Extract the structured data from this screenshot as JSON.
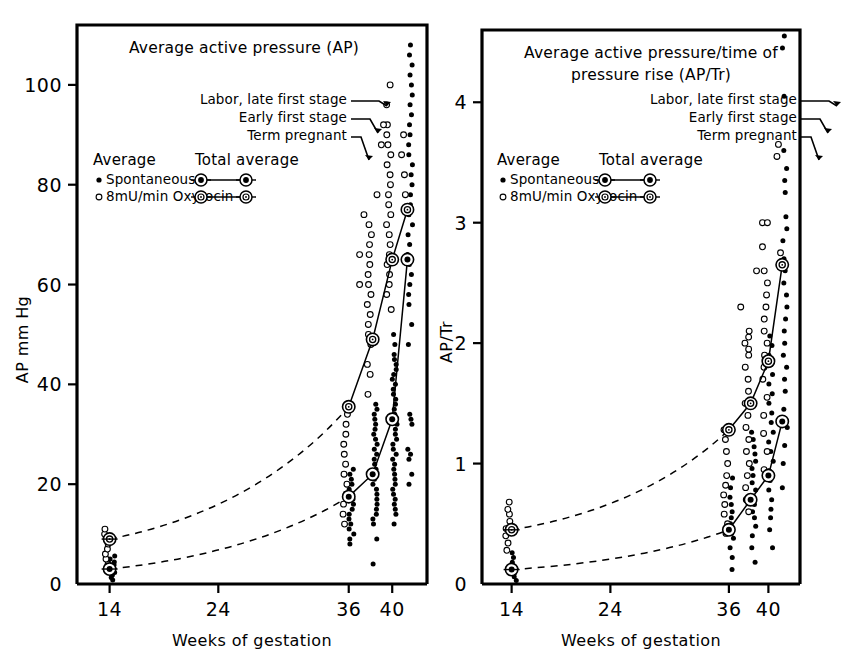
{
  "figure": {
    "background": "#ffffff",
    "ink": "#000000",
    "panel_count": 2
  },
  "panels": [
    {
      "id": "left",
      "title": [
        "Average active pressure (AP)"
      ],
      "ylabel": "AP mm Hg",
      "xlabel": "Weeks of gestation",
      "yticks": [
        "0",
        "20",
        "40",
        "60",
        "80",
        "100"
      ],
      "ytick_values": [
        0,
        20,
        40,
        60,
        80,
        100
      ],
      "xticks": [
        "14",
        "24",
        "36",
        "40"
      ],
      "xtick_values": [
        14,
        24,
        36,
        40
      ],
      "ylim": [
        0,
        112
      ],
      "xlim": [
        11,
        43.2
      ]
    },
    {
      "id": "right",
      "title": [
        "Average active pressure/time of",
        "pressure rise (AP/Tr)"
      ],
      "ylabel": "AP/Tr",
      "xlabel": "Weeks of gestation",
      "yticks": [
        "0",
        "1",
        "2",
        "3",
        "4"
      ],
      "ytick_values": [
        0,
        1,
        2,
        3,
        4
      ],
      "xticks": [
        "14",
        "24",
        "36",
        "40"
      ],
      "xtick_values": [
        14,
        24,
        36,
        40
      ],
      "ylim": [
        0,
        4.6
      ],
      "xlim": [
        11,
        43.2
      ]
    }
  ],
  "legend": {
    "average_heading": "Average",
    "total_average_heading": "Total average",
    "items": [
      {
        "marker": "filled-circle",
        "label": "Spontaneous"
      },
      {
        "marker": "open-circle",
        "label": "8mU/min Oxytocin"
      }
    ]
  },
  "annotations": [
    {
      "text": "Labor, late first stage"
    },
    {
      "text": "Early first stage"
    },
    {
      "text": "Term pregnant"
    }
  ],
  "chart_data": {
    "type": "scatter",
    "grid": false,
    "legend_position": "upper-left-inside",
    "panels": [
      {
        "id": "left",
        "title": "Average active pressure (AP)",
        "xlabel": "Weeks of gestation",
        "ylabel": "AP mm Hg",
        "xlim": [
          11,
          43.2
        ],
        "ylim": [
          0,
          112
        ],
        "xticks": [
          14,
          24,
          36,
          40
        ],
        "yticks": [
          0,
          20,
          40,
          60,
          80,
          100
        ],
        "series": [
          {
            "name": "Spontaneous",
            "marker": "filled-circle",
            "total_average_x": [
              14,
              36,
              38.2,
              40,
              41.4
            ],
            "total_average_y": [
              3.0,
              17.5,
              22.0,
              33.0,
              65.0
            ],
            "scatter": [
              {
                "x": 14,
                "values": [
                  0.8,
                  1.3,
                  1.8,
                  2.3,
                  2.8,
                  3.3,
                  3.8,
                  4.4,
                  5.0,
                  5.6
                ]
              },
              {
                "x": 36,
                "values": [
                  8.0,
                  9.0,
                  10.0,
                  11.0,
                  12.0,
                  13.0,
                  14.0,
                  15.0,
                  16.0,
                  17.0,
                  18.0,
                  19.0,
                  20.0,
                  21.0,
                  22.0,
                  23.0
                ]
              },
              {
                "x": 38.2,
                "values": [
                  4.0,
                  9.0,
                  12.0,
                  13.0,
                  14.0,
                  15.0,
                  16.0,
                  17.0,
                  18.0,
                  19.0,
                  20.0,
                  21.0,
                  22.0,
                  23.0,
                  24.0,
                  25.0,
                  26.0,
                  27.0,
                  28.0,
                  29.0,
                  30.0,
                  31.0,
                  32.0,
                  33.0,
                  34.0,
                  35.0,
                  36.0
                ]
              },
              {
                "x": 40,
                "values": [
                  12.0,
                  14.0,
                  15.0,
                  16.0,
                  17.0,
                  18.0,
                  19.0,
                  20.0,
                  21.0,
                  22.0,
                  23.0,
                  24.0,
                  25.0,
                  26.0,
                  27.0,
                  28.0,
                  29.0,
                  30.0,
                  31.0,
                  32.0,
                  33.0,
                  34.0,
                  35.0,
                  36.0,
                  37.0,
                  38.0,
                  39.0,
                  40.0,
                  41.0,
                  42.0,
                  43.0,
                  44.0,
                  45.0,
                  46.0,
                  48.0,
                  50.0
                ]
              },
              {
                "x": 41.4,
                "values": [
                  20.0,
                  22.0,
                  25.0,
                  26.0,
                  27.0,
                  32.0,
                  33.0,
                  34.0,
                  48.0,
                  52.0,
                  56.0,
                  58.0,
                  60.0,
                  62.0,
                  64.0,
                  66.0,
                  68.0,
                  70.0,
                  72.0,
                  74.0,
                  76.0,
                  78.0,
                  80.0,
                  82.0,
                  84.0,
                  86.0,
                  88.0,
                  90.0,
                  92.0,
                  94.0,
                  96.0,
                  98.0,
                  100.0,
                  102.0,
                  104.0,
                  106.0,
                  108.0
                ]
              }
            ]
          },
          {
            "name": "8mU/min Oxytocin",
            "marker": "open-circle",
            "total_average_x": [
              14,
              36,
              38.2,
              40,
              41.4
            ],
            "total_average_y": [
              9.0,
              35.5,
              49.0,
              65.0,
              75.0
            ],
            "scatter": [
              {
                "x": 14,
                "values": [
                  4.0,
                  5.0,
                  6.0,
                  7.0,
                  8.0,
                  9.0,
                  10.0,
                  11.0
                ]
              },
              {
                "x": 36,
                "values": [
                  12.0,
                  14.0,
                  16.0,
                  18.0,
                  20.0,
                  22.0,
                  24.0,
                  26.0,
                  28.0,
                  30.0,
                  32.0,
                  34.0,
                  36.0
                ]
              },
              {
                "x": 38.2,
                "values": [
                  38.0,
                  42.0,
                  44.0,
                  48.0,
                  50.0,
                  52.0,
                  54.0,
                  56.0,
                  58.0,
                  60.0,
                  62.0,
                  64.0,
                  66.0,
                  68.0,
                  70.0,
                  72.0
                ]
              },
              {
                "x": 40,
                "values": [
                  55.0,
                  58.0,
                  60.0,
                  62.0,
                  64.0,
                  66.0,
                  68.0,
                  70.0,
                  72.0,
                  74.0,
                  76.0,
                  78.0,
                  80.0,
                  82.0,
                  84.0,
                  86.0,
                  88.0,
                  90.0,
                  92.0,
                  96.0,
                  100.0
                ]
              },
              {
                "x": 41.4,
                "values": [
                  78.0,
                  82.0,
                  86.0,
                  90.0
                ]
              }
            ],
            "outliers": [
              {
                "x": 37.0,
                "y": 60.0
              },
              {
                "x": 37.0,
                "y": 66.0
              },
              {
                "x": 37.4,
                "y": 74.0
              },
              {
                "x": 38.6,
                "y": 78.0
              },
              {
                "x": 39.0,
                "y": 88.0
              },
              {
                "x": 39.2,
                "y": 92.0
              }
            ]
          }
        ],
        "trend_curves": [
          {
            "name": "oxytocin-trend",
            "style": "dashed",
            "from": [
              14,
              9.0
            ],
            "to": [
              36,
              35.5
            ]
          },
          {
            "name": "spontaneous-trend",
            "style": "dashed",
            "from": [
              14,
              3.0
            ],
            "to": [
              36,
              17.5
            ]
          }
        ]
      },
      {
        "id": "right",
        "title": "Average active pressure/time of pressure rise (AP/Tr)",
        "xlabel": "Weeks of gestation",
        "ylabel": "AP/Tr",
        "xlim": [
          11,
          43.2
        ],
        "ylim": [
          0,
          4.6
        ],
        "xticks": [
          14,
          24,
          36,
          40
        ],
        "yticks": [
          0,
          1,
          2,
          3,
          4
        ],
        "series": [
          {
            "name": "Spontaneous",
            "marker": "filled-circle",
            "total_average_x": [
              14,
              36,
              38.2,
              40,
              41.4
            ],
            "total_average_y": [
              0.12,
              0.45,
              0.7,
              0.9,
              1.35
            ],
            "scatter": [
              {
                "x": 14,
                "values": [
                  0.03,
                  0.06,
                  0.09,
                  0.12,
                  0.15,
                  0.18,
                  0.22,
                  0.26
                ]
              },
              {
                "x": 36,
                "values": [
                  0.12,
                  0.22,
                  0.3,
                  0.38,
                  0.42,
                  0.46,
                  0.5,
                  0.55,
                  0.6,
                  0.66,
                  0.72,
                  0.8,
                  0.88
                ]
              },
              {
                "x": 38.2,
                "values": [
                  0.18,
                  0.3,
                  0.4,
                  0.48,
                  0.55,
                  0.6,
                  0.66,
                  0.72,
                  0.78,
                  0.84,
                  0.9,
                  0.96,
                  1.02,
                  1.08,
                  1.14,
                  1.2,
                  1.26
                ]
              },
              {
                "x": 40,
                "values": [
                  0.3,
                  0.45,
                  0.55,
                  0.62,
                  0.7,
                  0.78,
                  0.86,
                  0.94,
                  1.02,
                  1.1,
                  1.18,
                  1.26,
                  1.34,
                  1.42,
                  1.5,
                  1.58,
                  1.66,
                  1.74,
                  1.82,
                  1.9,
                  1.98,
                  2.06
                ]
              },
              {
                "x": 41.4,
                "values": [
                  0.8,
                  1.0,
                  1.15,
                  1.3,
                  1.45,
                  1.6,
                  1.7,
                  1.8,
                  1.9,
                  2.0,
                  2.1,
                  2.2,
                  2.3,
                  2.4,
                  2.5,
                  2.6,
                  2.7,
                  2.85,
                  2.95,
                  3.05,
                  3.25,
                  3.35,
                  3.45,
                  3.6,
                  4.05,
                  4.45,
                  4.55
                ]
              }
            ]
          },
          {
            "name": "8mU/min Oxytocin",
            "marker": "open-circle",
            "total_average_x": [
              14,
              36,
              38.2,
              40,
              41.4
            ],
            "total_average_y": [
              0.45,
              1.28,
              1.5,
              1.85,
              2.65
            ],
            "scatter": [
              {
                "x": 14,
                "values": [
                  0.28,
                  0.34,
                  0.4,
                  0.46,
                  0.52,
                  0.58,
                  0.62,
                  0.68
                ]
              },
              {
                "x": 36,
                "values": [
                  0.42,
                  0.5,
                  0.58,
                  0.66,
                  0.74,
                  0.82,
                  0.9,
                  1.0,
                  1.1,
                  1.2,
                  1.28
                ]
              },
              {
                "x": 38.2,
                "values": [
                  0.6,
                  0.7,
                  0.8,
                  0.9,
                  1.0,
                  1.1,
                  1.2,
                  1.3,
                  1.4,
                  1.5,
                  1.6,
                  1.7,
                  1.8,
                  1.9,
                  2.0,
                  2.1
                ]
              },
              {
                "x": 40,
                "values": [
                  0.95,
                  1.1,
                  1.25,
                  1.4,
                  1.55,
                  1.7,
                  1.8,
                  1.9,
                  2.0,
                  2.1,
                  2.2,
                  2.3,
                  2.4,
                  2.5,
                  2.6
                ]
              },
              {
                "x": 41.4,
                "values": [
                  2.75,
                  3.55,
                  3.65
                ]
              }
            ],
            "outliers": [
              {
                "x": 37.2,
                "y": 2.3
              },
              {
                "x": 38.0,
                "y": 1.95
              },
              {
                "x": 38.0,
                "y": 2.05
              },
              {
                "x": 38.8,
                "y": 2.6
              },
              {
                "x": 39.4,
                "y": 2.8
              },
              {
                "x": 39.4,
                "y": 3.0
              },
              {
                "x": 39.9,
                "y": 3.0
              }
            ]
          }
        ],
        "trend_curves": [
          {
            "name": "oxytocin-trend",
            "style": "dashed",
            "from": [
              14,
              0.45
            ],
            "to": [
              36,
              1.28
            ]
          },
          {
            "name": "spontaneous-trend",
            "style": "dashed",
            "from": [
              14,
              0.12
            ],
            "to": [
              36,
              0.45
            ]
          }
        ]
      }
    ]
  }
}
